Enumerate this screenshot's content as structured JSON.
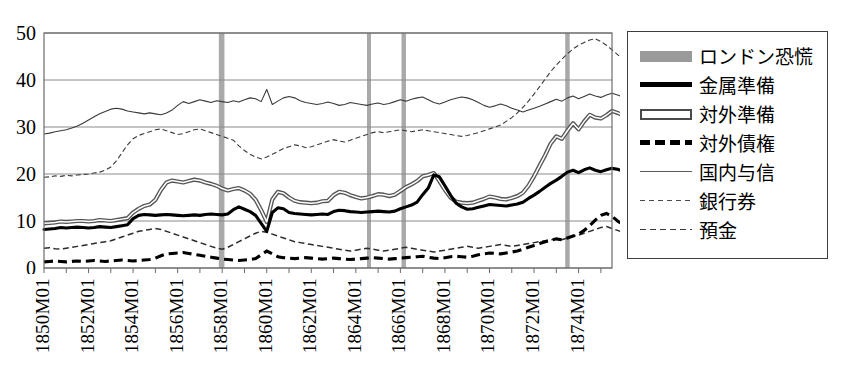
{
  "top_cropped_text": "                                                                                                                  ",
  "legend": {
    "items": [
      {
        "label": "ロンドン恐慌",
        "key": "band",
        "name": "legend-key-london-panic"
      },
      {
        "label": "金属準備",
        "key": "metal",
        "name": "legend-key-metallic-reserve"
      },
      {
        "label": "対外準備",
        "key": "fres",
        "name": "legend-key-foreign-reserve"
      },
      {
        "label": "対外債権",
        "key": "fdebt",
        "name": "legend-key-foreign-claims"
      },
      {
        "label": "国内与信",
        "key": "dom",
        "name": "legend-key-domestic-credit"
      },
      {
        "label": "銀行券",
        "key": "notes",
        "name": "legend-key-banknotes"
      },
      {
        "label": "預金",
        "key": "dep",
        "name": "legend-key-deposits"
      }
    ]
  },
  "chart_data": {
    "type": "line",
    "title": "",
    "xlabel": "",
    "ylabel": "",
    "ylim": [
      0,
      50
    ],
    "yticks": [
      0,
      10,
      20,
      30,
      40,
      50
    ],
    "grid": true,
    "legend_position": "right",
    "xlim": [
      "1850M01",
      "1875M06"
    ],
    "xtick_labels": [
      "1850M01",
      "1852M01",
      "1854M01",
      "1856M01",
      "1858M01",
      "1860M01",
      "1862M01",
      "1864M01",
      "1866M01",
      "1868M01",
      "1870M01",
      "1872M01",
      "1874M01"
    ],
    "xtick_years": [
      1850,
      1852,
      1854,
      1856,
      1858,
      1860,
      1862,
      1864,
      1866,
      1868,
      1870,
      1872,
      1874
    ],
    "minor_tick_years": [
      1851,
      1853,
      1855,
      1857,
      1859,
      1861,
      1863,
      1865,
      1867,
      1869,
      1871,
      1873,
      1875
    ],
    "crisis_bands": [
      {
        "label": "1857-58 London panic",
        "start": 1857.85,
        "end": 1858.1
      },
      {
        "label": "1864-65 London panic",
        "start": 1864.5,
        "end": 1864.68
      },
      {
        "label": "1866 London panic",
        "start": 1866.05,
        "end": 1866.25
      },
      {
        "label": "1873 London panic",
        "start": 1873.4,
        "end": 1873.6
      }
    ],
    "x_start": 1850.0,
    "x_step": 0.25,
    "series": [
      {
        "name": "金属準備",
        "id": "metal",
        "style": "solid-thick-black",
        "values": [
          8.2,
          8.3,
          8.4,
          8.6,
          8.5,
          8.6,
          8.7,
          8.6,
          8.5,
          8.6,
          8.8,
          8.7,
          8.6,
          8.8,
          9.0,
          9.2,
          10.5,
          11.2,
          11.4,
          11.3,
          11.2,
          11.3,
          11.4,
          11.3,
          11.2,
          11.1,
          11.2,
          11.3,
          11.2,
          11.4,
          11.5,
          11.4,
          11.3,
          11.5,
          12.4,
          13.0,
          12.5,
          12.0,
          11.2,
          9.5,
          7.8,
          11.8,
          12.8,
          12.6,
          11.8,
          11.6,
          11.5,
          11.4,
          11.3,
          11.4,
          11.5,
          11.4,
          12.0,
          12.3,
          12.2,
          12.0,
          11.9,
          11.8,
          11.9,
          12.0,
          12.1,
          12.0,
          11.9,
          12.1,
          12.6,
          13.0,
          13.4,
          14.0,
          15.6,
          17.0,
          19.8,
          19.4,
          17.5,
          15.5,
          13.8,
          13.0,
          12.5,
          12.6,
          12.9,
          13.2,
          13.5,
          13.4,
          13.3,
          13.2,
          13.4,
          13.6,
          14.0,
          14.8,
          15.5,
          16.3,
          17.2,
          18.0,
          18.7,
          19.5,
          20.4,
          20.8,
          20.3,
          20.9,
          21.3,
          20.8,
          20.5,
          20.9,
          21.2,
          21.0,
          20.6,
          20.4,
          20.2,
          20.0,
          19.6,
          19.0,
          18.2,
          17.0,
          15.5,
          14.3,
          13.8,
          14.6
        ]
      },
      {
        "name": "対外準備",
        "id": "foreign_reserve",
        "style": "solid-thick-outlined",
        "values": [
          9.5,
          9.6,
          9.7,
          9.9,
          9.8,
          9.9,
          10.0,
          10.0,
          9.9,
          10.0,
          10.2,
          10.1,
          10.0,
          10.2,
          10.4,
          10.6,
          11.8,
          12.6,
          13.2,
          13.5,
          14.5,
          16.6,
          18.2,
          18.6,
          18.4,
          18.2,
          18.5,
          18.8,
          18.6,
          18.2,
          17.9,
          17.5,
          16.9,
          16.5,
          16.8,
          17.0,
          16.5,
          15.8,
          14.5,
          12.3,
          9.8,
          14.6,
          16.2,
          15.9,
          15.0,
          14.3,
          14.0,
          13.9,
          13.8,
          13.9,
          14.2,
          14.3,
          15.5,
          16.2,
          16.0,
          15.5,
          15.1,
          14.8,
          15.0,
          15.3,
          15.7,
          15.6,
          15.3,
          15.6,
          16.4,
          17.2,
          17.8,
          18.5,
          19.5,
          19.8,
          20.2,
          18.5,
          16.6,
          15.0,
          14.1,
          13.9,
          13.8,
          13.9,
          14.3,
          14.7,
          15.2,
          15.0,
          14.7,
          14.6,
          14.9,
          15.3,
          16.0,
          17.5,
          19.5,
          21.8,
          24.0,
          26.5,
          28.0,
          27.5,
          29.2,
          30.8,
          29.5,
          31.2,
          32.6,
          32.0,
          31.8,
          32.5,
          33.4,
          33.0,
          32.5,
          32.3,
          32.0,
          31.5,
          30.0,
          28.5,
          27.5,
          26.5,
          25.5,
          24.8,
          24.2,
          23.8
        ]
      },
      {
        "name": "対外債権",
        "id": "foreign_claims",
        "style": "dashed-thick-black",
        "values": [
          1.3,
          1.4,
          1.5,
          1.4,
          1.3,
          1.4,
          1.5,
          1.4,
          1.5,
          1.6,
          1.5,
          1.4,
          1.5,
          1.6,
          1.7,
          1.6,
          1.5,
          1.6,
          1.7,
          1.8,
          2.1,
          2.6,
          3.0,
          3.1,
          3.2,
          3.3,
          3.1,
          2.9,
          2.7,
          2.5,
          2.3,
          2.1,
          1.9,
          1.8,
          1.7,
          1.6,
          1.7,
          1.8,
          2.0,
          2.8,
          3.6,
          3.0,
          2.4,
          2.2,
          2.1,
          2.0,
          2.1,
          2.2,
          2.1,
          2.0,
          1.9,
          2.0,
          2.1,
          2.0,
          1.9,
          1.8,
          1.9,
          2.0,
          2.1,
          2.2,
          2.1,
          2.0,
          1.9,
          2.0,
          2.1,
          2.2,
          2.3,
          2.4,
          2.5,
          2.3,
          2.1,
          2.0,
          2.2,
          2.4,
          2.5,
          2.4,
          2.3,
          2.5,
          2.8,
          3.0,
          3.2,
          3.1,
          3.0,
          3.2,
          3.4,
          3.6,
          4.0,
          4.4,
          4.8,
          5.2,
          5.6,
          5.9,
          6.2,
          6.0,
          6.4,
          6.8,
          7.2,
          8.0,
          9.0,
          10.2,
          11.2,
          11.6,
          11.0,
          10.0,
          9.2,
          8.4,
          7.8,
          7.5,
          7.2,
          7.0,
          6.8,
          7.0,
          7.2,
          7.0,
          6.8,
          7.0
        ]
      },
      {
        "name": "国内与信",
        "id": "domestic_credit",
        "style": "solid-thin-gray",
        "values": [
          28.5,
          28.7,
          29.0,
          29.2,
          29.4,
          29.8,
          30.2,
          30.8,
          31.5,
          32.2,
          32.8,
          33.3,
          33.8,
          34.0,
          33.8,
          33.4,
          33.2,
          33.0,
          32.8,
          33.0,
          32.8,
          32.6,
          33.0,
          33.6,
          34.6,
          35.4,
          35.0,
          35.4,
          35.8,
          35.5,
          35.2,
          35.6,
          35.4,
          35.2,
          35.6,
          35.3,
          35.8,
          36.2,
          36.0,
          35.4,
          38.0,
          34.8,
          35.5,
          36.2,
          36.5,
          36.2,
          35.6,
          35.2,
          35.0,
          34.8,
          35.0,
          35.3,
          35.0,
          34.6,
          34.8,
          35.2,
          35.0,
          34.8,
          34.6,
          34.9,
          35.1,
          34.8,
          35.0,
          35.4,
          35.8,
          35.5,
          35.9,
          36.2,
          36.4,
          35.8,
          35.2,
          34.9,
          35.3,
          35.8,
          36.1,
          36.4,
          36.2,
          35.8,
          35.2,
          34.6,
          34.2,
          34.5,
          34.9,
          34.5,
          34.0,
          33.6,
          33.2,
          33.6,
          34.0,
          34.4,
          34.9,
          35.4,
          35.9,
          35.5,
          36.2,
          36.6,
          36.0,
          36.5,
          37.0,
          36.6,
          36.3,
          36.8,
          37.2,
          36.8,
          36.4,
          36.8,
          37.4,
          37.8,
          38.2,
          38.6,
          39.0,
          39.4,
          39.6,
          39.2,
          39.4,
          39.8
        ]
      },
      {
        "name": "銀行券",
        "id": "banknotes",
        "style": "dashed-thin-gray",
        "values": [
          19.3,
          19.4,
          19.6,
          19.5,
          19.7,
          19.6,
          19.8,
          19.9,
          20.0,
          20.2,
          20.4,
          20.8,
          21.5,
          22.8,
          24.5,
          26.2,
          27.5,
          28.2,
          28.6,
          29.0,
          29.4,
          29.6,
          29.2,
          28.8,
          28.4,
          28.6,
          29.0,
          29.4,
          29.6,
          29.2,
          28.8,
          28.4,
          28.0,
          27.6,
          27.2,
          26.0,
          25.0,
          24.2,
          23.6,
          23.2,
          23.6,
          24.2,
          24.8,
          25.4,
          25.8,
          26.2,
          26.0,
          25.6,
          25.8,
          26.2,
          26.6,
          27.0,
          27.3,
          27.0,
          26.8,
          27.2,
          27.6,
          28.0,
          28.4,
          28.8,
          29.0,
          28.8,
          29.0,
          29.2,
          29.4,
          29.2,
          29.0,
          29.2,
          29.4,
          29.2,
          29.0,
          28.8,
          28.6,
          28.4,
          28.2,
          28.0,
          28.2,
          28.5,
          28.8,
          29.2,
          29.6,
          30.0,
          30.4,
          31.2,
          32.0,
          33.0,
          34.2,
          35.5,
          37.0,
          38.6,
          40.2,
          41.8,
          43.2,
          44.4,
          45.6,
          46.6,
          47.4,
          48.0,
          48.5,
          48.8,
          48.2,
          47.4,
          46.4,
          45.4,
          44.4,
          43.4,
          42.4,
          41.4,
          40.6,
          40.0,
          39.4,
          39.0,
          38.6,
          38.8,
          39.2,
          39.8
        ]
      },
      {
        "name": "預金",
        "id": "deposits",
        "style": "dashed-medium-black",
        "values": [
          4.2,
          4.3,
          4.1,
          4.0,
          4.2,
          4.4,
          4.6,
          4.8,
          5.0,
          5.2,
          5.4,
          5.6,
          5.8,
          6.2,
          6.6,
          7.0,
          7.4,
          7.8,
          8.0,
          8.2,
          8.4,
          8.2,
          7.8,
          7.4,
          7.0,
          6.6,
          6.2,
          5.8,
          5.4,
          5.0,
          4.6,
          4.2,
          4.0,
          4.4,
          5.0,
          5.6,
          6.2,
          6.8,
          7.4,
          7.8,
          7.6,
          7.2,
          6.8,
          6.4,
          6.0,
          5.6,
          5.4,
          5.2,
          5.0,
          4.8,
          4.6,
          4.4,
          4.2,
          4.0,
          3.8,
          3.6,
          3.8,
          4.0,
          4.2,
          4.0,
          3.8,
          3.6,
          3.8,
          4.0,
          4.2,
          4.4,
          4.2,
          4.0,
          3.8,
          3.6,
          3.4,
          3.6,
          3.8,
          4.0,
          4.2,
          4.4,
          4.6,
          4.4,
          4.2,
          4.4,
          4.6,
          4.8,
          5.0,
          4.8,
          4.6,
          4.8,
          5.0,
          5.2,
          5.4,
          5.6,
          5.8,
          6.0,
          6.2,
          6.0,
          6.4,
          6.8,
          7.0,
          7.4,
          7.8,
          8.2,
          8.6,
          8.8,
          8.4,
          8.0,
          7.6,
          7.8,
          8.0,
          8.2,
          8.4,
          8.2,
          8.0,
          8.4,
          8.8,
          9.0,
          9.2,
          9.0
        ]
      }
    ]
  }
}
